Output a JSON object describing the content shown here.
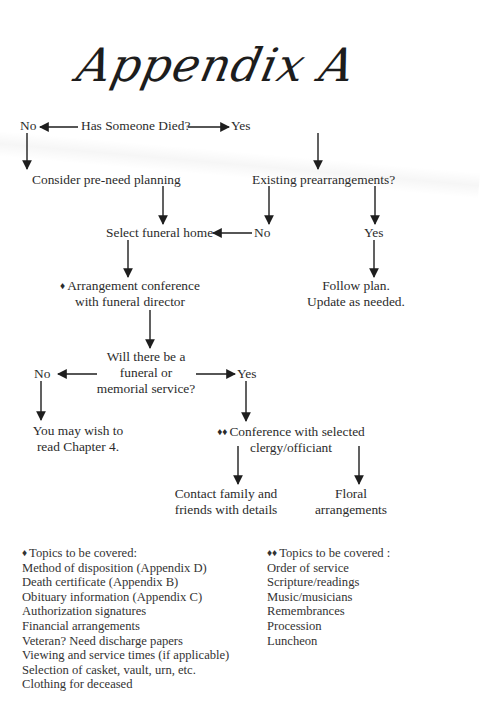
{
  "title": "Appendix A",
  "flowchart": {
    "start": {
      "label": "Has Someone Died?"
    },
    "start_no": "No",
    "start_yes": "Yes",
    "consider_preneed": "Consider pre-need planning",
    "existing_prearrangements": "Existing prearrangements?",
    "select_funeral_home": "Select funeral home",
    "prearr_no": "No",
    "prearr_yes": "Yes",
    "arrangement_conference": [
      "Arrangement conference",
      "with funeral director"
    ],
    "arrangement_marker": "♦",
    "follow_plan": [
      "Follow plan.",
      "Update as needed."
    ],
    "service_question": [
      "Will there be a",
      "funeral or",
      "memorial service?"
    ],
    "service_no": "No",
    "service_yes": "Yes",
    "read_chapter": [
      "You may wish to",
      "read Chapter 4."
    ],
    "clergy_conference": [
      "Conference with selected",
      "clergy/officiant"
    ],
    "clergy_marker": "♦♦",
    "contact_family": [
      "Contact family and",
      "friends with details"
    ],
    "floral": [
      "Floral",
      "arrangements"
    ]
  },
  "lists": {
    "funeral_director_topics": {
      "marker": "♦",
      "heading": "Topics to be covered:",
      "items": [
        "Method of disposition (Appendix D)",
        "Death certificate (Appendix B)",
        "Obituary information (Appendix C)",
        "Authorization signatures",
        "Financial arrangements",
        "Veteran? Need discharge papers",
        "Viewing and service times (if applicable)",
        "Selection of casket, vault, urn, etc.",
        "Clothing for deceased"
      ]
    },
    "clergy_topics": {
      "marker": "♦♦",
      "heading": "Topics to be covered :",
      "items": [
        "Order of service",
        "Scripture/readings",
        "Music/musicians",
        "Remembrances",
        "Procession",
        "Luncheon"
      ]
    }
  },
  "colors": {
    "text": "#2b2b2b",
    "arrow": "#1e1e1e",
    "background": "#ffffff"
  }
}
